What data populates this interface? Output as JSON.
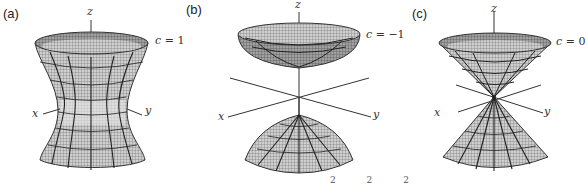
{
  "figure": {
    "panels": [
      {
        "id": "a",
        "label": "(a)",
        "surface": "hyperboloid of one sheet",
        "c_label": "c = 1",
        "c_var": "c",
        "c_eq": " = 1",
        "axes": {
          "x": "x",
          "y": "y",
          "z": "z"
        }
      },
      {
        "id": "b",
        "label": "(b)",
        "surface": "hyperboloid of two sheets",
        "c_label": "c = −1",
        "c_var": "c",
        "c_eq": " = −1",
        "axes": {
          "x": "x",
          "y": "y",
          "z": "z"
        }
      },
      {
        "id": "c",
        "label": "(c)",
        "surface": "double cone",
        "c_label": "c = 0",
        "c_var": "c",
        "c_eq": " = 0",
        "axes": {
          "x": "x",
          "y": "y",
          "z": "z"
        }
      }
    ],
    "caption_fragment": "2 2 2",
    "colors": {
      "mesh": "#333333",
      "fill": "#d8d8d8",
      "fill_dark": "#9a9a9a",
      "axis": "#444444"
    }
  }
}
